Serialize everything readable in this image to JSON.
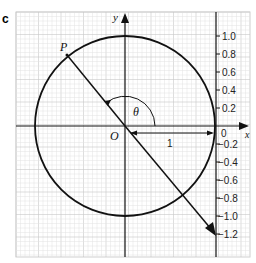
{
  "figure": {
    "part_label": "c",
    "axes": {
      "x_label": "x",
      "y_label": "y",
      "origin_label": "O"
    },
    "point_label": "P",
    "angle_label": "θ",
    "radius_label": "1",
    "scale": {
      "zero_label": "0",
      "ticks": [
        "1.0",
        "0.8",
        "0.6",
        "0.4",
        "0.2",
        "−0.2",
        "−0.4",
        "−0.6",
        "−0.8",
        "−1.0",
        "−1.2"
      ]
    },
    "colors": {
      "line": "#111111",
      "grid": "#e2e2e2",
      "text": "#222222"
    }
  }
}
